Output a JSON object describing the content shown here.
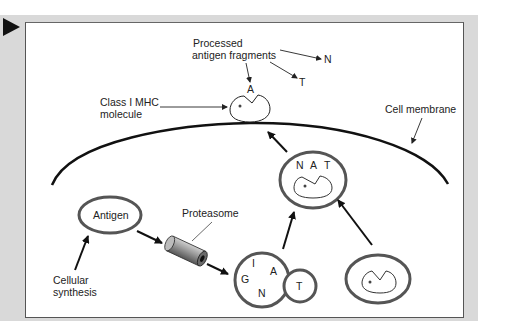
{
  "figure": {
    "nav_marker": "play-triangle",
    "labels": {
      "processed_line1": "Processed",
      "processed_line2": "antigen fragments",
      "class_line1": "Class I MHC",
      "class_line2": "molecule",
      "cell_membrane": "Cell membrane",
      "antigen": "Antigen",
      "proteasome": "Proteasome",
      "cellular_line1": "Cellular",
      "cellular_line2": "synthesis"
    },
    "fragments_outside": {
      "n": "N",
      "t": "T",
      "a": "A"
    },
    "vesicle_top_letters": {
      "n": "N",
      "a": "A",
      "t": "T"
    },
    "peptide_cluster_letters": {
      "i": "I",
      "g": "G",
      "a": "A",
      "n": "N",
      "t": "T"
    },
    "colors": {
      "panel": "#d9d9d9",
      "stroke": "#111111",
      "ring": "#555555"
    }
  }
}
